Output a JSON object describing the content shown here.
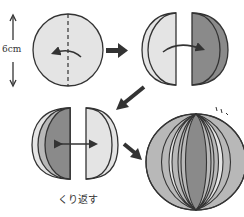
{
  "diagram": {
    "dimension_label": "6cm",
    "caption": "くり返す",
    "steps": [
      {
        "id": 1,
        "description": "circle with dashed center fold line, curved arrow pointing left"
      },
      {
        "id": 2,
        "description": "two halves, left light half and right dark half, curved arrow pointing right"
      },
      {
        "id": 3,
        "description": "stacked halves with double-headed arrow"
      },
      {
        "id": 4,
        "description": "completed sphere of alternating shaded segments"
      }
    ],
    "colors": {
      "light": "#e4e4e4",
      "mid": "#b8b8b8",
      "dark": "#8a8a8a",
      "outline": "#333333"
    }
  }
}
